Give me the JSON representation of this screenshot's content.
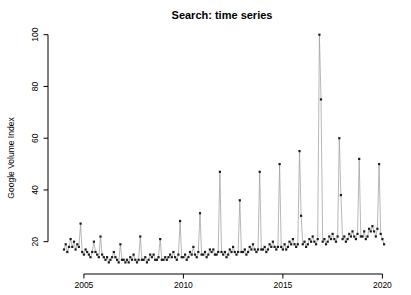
{
  "chart_data": {
    "type": "line",
    "title": "Search: time series",
    "ylabel": "Google Volume Index",
    "xlabel": "",
    "series_name": "Google search volume index (monthly)",
    "start_year": 2004,
    "frequency": "monthly",
    "end_label": "early 2020",
    "x_ticks": [
      2005,
      2010,
      2015,
      2020
    ],
    "y_ticks": [
      20,
      40,
      60,
      80,
      100
    ],
    "ylim": [
      12,
      100
    ],
    "grid": false,
    "legend": "none",
    "marker": "filled-square",
    "annual_peaks": {
      "2004": 27,
      "2005": 22,
      "2006": 19,
      "2007": 22,
      "2008": 21,
      "2009": 28,
      "2010": 31,
      "2011": 47,
      "2012": 36,
      "2013": 47,
      "2014": 50,
      "2015": 55,
      "2016": 100,
      "2017": 60,
      "2018": 52,
      "2019": 50
    },
    "values": [
      17,
      19,
      16,
      18,
      21,
      18,
      20,
      17,
      19,
      18,
      27,
      16,
      15,
      17,
      16,
      15,
      14,
      16,
      20,
      16,
      15,
      14,
      22,
      15,
      14,
      13,
      14,
      12,
      13,
      14,
      16,
      14,
      13,
      12,
      19,
      13,
      13,
      12,
      13,
      12,
      14,
      13,
      15,
      13,
      12,
      13,
      22,
      13,
      13,
      14,
      12,
      13,
      15,
      14,
      15,
      13,
      13,
      14,
      21,
      13,
      13,
      14,
      13,
      14,
      15,
      14,
      16,
      14,
      13,
      15,
      28,
      14,
      14,
      15,
      13,
      14,
      16,
      15,
      18,
      15,
      14,
      16,
      31,
      15,
      15,
      16,
      14,
      15,
      17,
      16,
      17,
      15,
      15,
      16,
      47,
      16,
      15,
      16,
      14,
      15,
      17,
      16,
      18,
      16,
      15,
      16,
      36,
      16,
      16,
      17,
      15,
      16,
      18,
      17,
      19,
      17,
      16,
      17,
      47,
      17,
      17,
      18,
      16,
      17,
      19,
      18,
      20,
      18,
      17,
      18,
      50,
      18,
      17,
      19,
      17,
      18,
      20,
      19,
      21,
      19,
      18,
      19,
      55,
      30,
      19,
      20,
      18,
      19,
      21,
      20,
      22,
      20,
      19,
      21,
      100,
      75,
      20,
      21,
      19,
      20,
      22,
      21,
      23,
      21,
      20,
      22,
      60,
      38,
      21,
      22,
      20,
      21,
      23,
      22,
      24,
      22,
      21,
      23,
      52,
      22,
      22,
      24,
      21,
      22,
      25,
      24,
      26,
      24,
      22,
      25,
      50,
      23,
      21,
      19
    ],
    "colors": {
      "points": "#1c1c1c",
      "line": "#9a9a9a",
      "axis": "#000000",
      "text": "#000000",
      "background": "#ffffff"
    }
  }
}
